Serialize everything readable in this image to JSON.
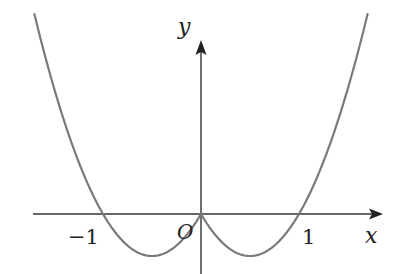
{
  "chart_data": {
    "type": "line",
    "title": "",
    "xlabel": "x",
    "ylabel": "y",
    "origin_label": "O",
    "tick_labels": [
      {
        "value": -1,
        "text": "−1"
      },
      {
        "value": 1,
        "text": "1"
      }
    ],
    "function": "y = x^2 - |x|",
    "x_intercepts": [
      -1,
      0,
      1
    ],
    "minima": [
      {
        "x": -0.5,
        "y": -0.25
      },
      {
        "x": 0.5,
        "y": -0.25
      }
    ],
    "grid": false,
    "legend": null,
    "xlim": [
      -1.7,
      1.7
    ],
    "colors": {
      "curve": "#7a7a7a",
      "axes": "#333333"
    }
  }
}
